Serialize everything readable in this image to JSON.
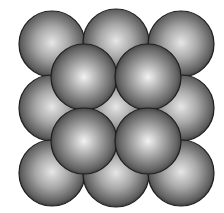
{
  "figure": {
    "background": "#ffffff",
    "sphere_color_light": "#ececec",
    "sphere_color_mid": "#9a9a9a",
    "sphere_color_dark": "#3a3a3a",
    "outline_color": "#1e1e1e",
    "radius": 33,
    "bottom_layer": [
      {
        "cx": 52,
        "cy": 44
      },
      {
        "cx": 116,
        "cy": 42
      },
      {
        "cx": 181,
        "cy": 44
      },
      {
        "cx": 52,
        "cy": 108
      },
      {
        "cx": 116,
        "cy": 108
      },
      {
        "cx": 181,
        "cy": 108
      },
      {
        "cx": 52,
        "cy": 173
      },
      {
        "cx": 116,
        "cy": 174
      },
      {
        "cx": 181,
        "cy": 173
      }
    ],
    "top_layer": [
      {
        "cx": 84,
        "cy": 77
      },
      {
        "cx": 148,
        "cy": 77
      },
      {
        "cx": 84,
        "cy": 141
      },
      {
        "cx": 148,
        "cy": 141
      }
    ]
  }
}
